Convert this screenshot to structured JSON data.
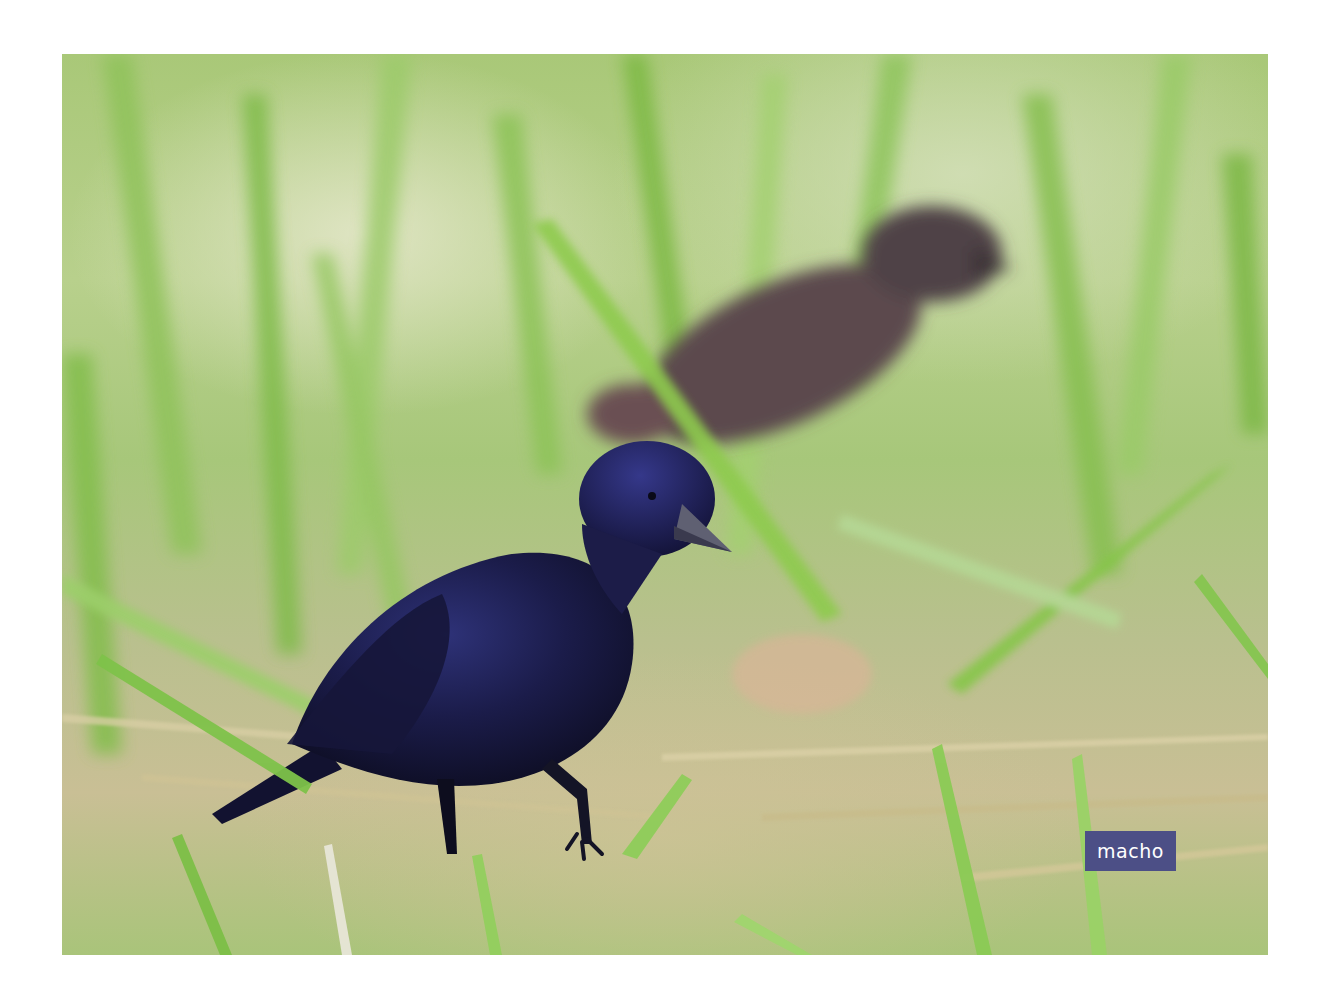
{
  "image": {
    "subject": "male bird (black, glossy blue-violet) walking in grass, with a blurred brown female bird in background",
    "colors": {
      "background_page": "#ffffff",
      "grass_light": "#b8d08c",
      "grass_bright": "#7fbf3f",
      "dry_grass": "#c9bf95",
      "male_bird": "#1c1c45",
      "female_bird": "#5b4a4e",
      "label_bg": "#4c4f86",
      "label_text": "#ffffff"
    }
  },
  "label": {
    "text": "macho"
  }
}
